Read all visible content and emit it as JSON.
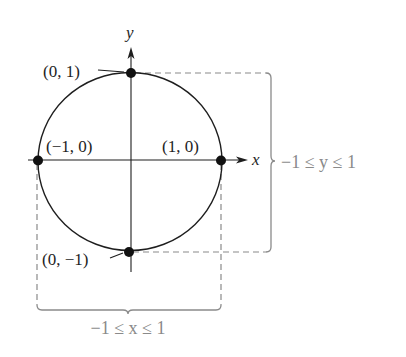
{
  "diagram": {
    "type": "unit-circle-domain-range",
    "axes": {
      "x_label": "x",
      "y_label": "y"
    },
    "circle": {
      "center": [
        0,
        0
      ],
      "radius": 1
    },
    "points": [
      {
        "id": "top",
        "label": "(0, 1)",
        "coords": [
          0,
          1
        ]
      },
      {
        "id": "left",
        "label": "(−1, 0)",
        "coords": [
          -1,
          0
        ]
      },
      {
        "id": "right",
        "label": "(1, 0)",
        "coords": [
          1,
          0
        ]
      },
      {
        "id": "bottom",
        "label": "(0, −1)",
        "coords": [
          0,
          -1
        ]
      }
    ],
    "brackets": {
      "range": {
        "label": "−1 ≤ y ≤ 1",
        "variable": "y"
      },
      "domain": {
        "label": "−1 ≤ x ≤ 1",
        "variable": "x"
      }
    },
    "colors": {
      "ink": "#1e1e1e",
      "guide": "#8a8a8a",
      "background": "#ffffff"
    }
  }
}
